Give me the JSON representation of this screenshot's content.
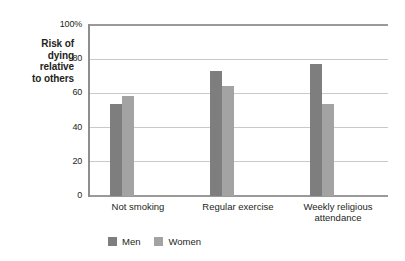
{
  "chart_data": {
    "type": "bar",
    "title": "",
    "xlabel": "",
    "ylabel": "Risk of dying relative to others",
    "ylabel_lines": [
      "Risk of",
      "dying",
      "relative",
      "to others"
    ],
    "categories": [
      "Not smoking",
      "Regular exercise",
      "Weekly religious attendance"
    ],
    "category_lines": [
      [
        "Not smoking"
      ],
      [
        "Regular exercise"
      ],
      [
        "Weekly religious",
        "attendance"
      ]
    ],
    "series": [
      {
        "name": "Men",
        "color": "#7e7e7e",
        "values": [
          54,
          73,
          77
        ]
      },
      {
        "name": "Women",
        "color": "#a3a3a3",
        "values": [
          58.5,
          64.5,
          54
        ]
      }
    ],
    "ylim": [
      0,
      100
    ],
    "yticks": [
      0,
      20,
      40,
      60,
      80,
      100
    ],
    "ytick_labels": [
      "0",
      "20",
      "40",
      "60",
      "80",
      "100%"
    ],
    "grid": true,
    "legend_position": "bottom-left",
    "axis_color": "#8e8e8e",
    "gridline_color": "#c9c9c9",
    "background": "#ffffff"
  }
}
